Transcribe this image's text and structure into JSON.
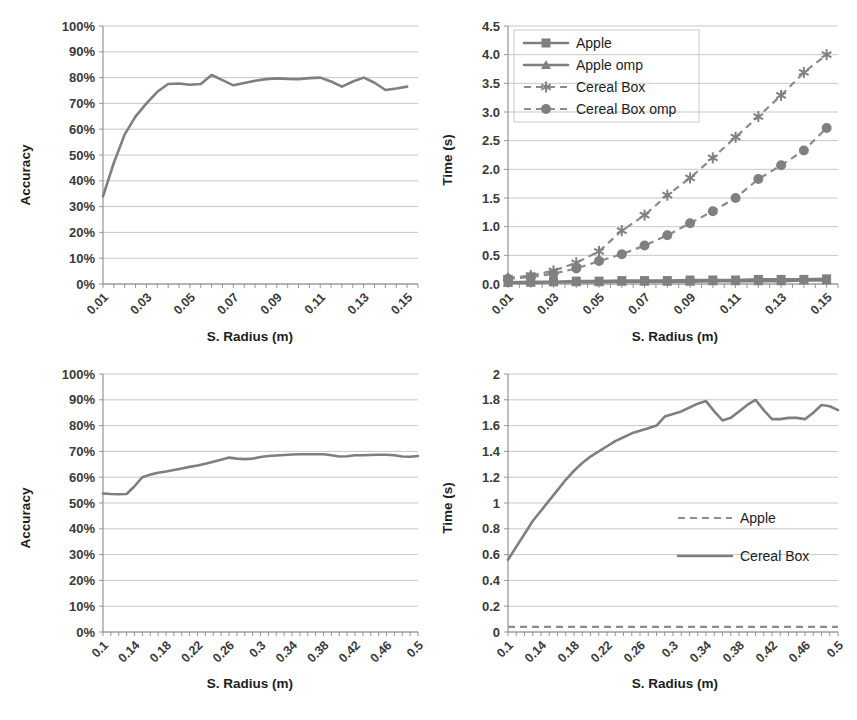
{
  "figure": {
    "panels": [
      "accuracy-small-radius",
      "time-small-radius",
      "accuracy-large-radius",
      "time-large-radius"
    ],
    "axis_title_x": "S. Radius (m)",
    "axis_title_y_accuracy": "Accuracy",
    "axis_title_y_time": "Time (s)",
    "colors": {
      "line": "#7f7f7f",
      "grid": "#b9b9b9",
      "axis": "#8a8a8a",
      "text": "#262626"
    }
  },
  "chart_data": [
    {
      "id": "accuracy-small-radius",
      "type": "line",
      "title": "",
      "xlabel": "S. Radius (m)",
      "ylabel": "Accuracy",
      "xlim": [
        0.01,
        0.155
      ],
      "ylim": [
        0,
        1.0
      ],
      "grid": true,
      "legend": null,
      "ytick_labels": [
        "100%",
        "90%",
        "80%",
        "70%",
        "60%",
        "50%",
        "40%",
        "30%",
        "20%",
        "10%",
        "0%"
      ],
      "ytick_values": [
        1.0,
        0.9,
        0.8,
        0.7,
        0.6,
        0.5,
        0.4,
        0.3,
        0.2,
        0.1,
        0.0
      ],
      "xtick_labels": [
        "0.01",
        "0.03",
        "0.05",
        "0.07",
        "0.09",
        "0.11",
        "0.13",
        "0.15"
      ],
      "xtick_values": [
        0.01,
        0.03,
        0.05,
        0.07,
        0.09,
        0.11,
        0.13,
        0.15
      ],
      "x": [
        0.01,
        0.015,
        0.02,
        0.025,
        0.03,
        0.035,
        0.04,
        0.045,
        0.05,
        0.055,
        0.06,
        0.065,
        0.07,
        0.075,
        0.08,
        0.085,
        0.09,
        0.095,
        0.1,
        0.105,
        0.11,
        0.115,
        0.12,
        0.125,
        0.13,
        0.135,
        0.14,
        0.145,
        0.15
      ],
      "series": [
        {
          "name": "Accuracy",
          "values": [
            0.34,
            0.47,
            0.58,
            0.65,
            0.7,
            0.745,
            0.775,
            0.777,
            0.772,
            0.775,
            0.81,
            0.79,
            0.77,
            0.779,
            0.788,
            0.794,
            0.797,
            0.795,
            0.794,
            0.798,
            0.8,
            0.785,
            0.765,
            0.785,
            0.8,
            0.78,
            0.752,
            0.758,
            0.765
          ]
        }
      ]
    },
    {
      "id": "time-small-radius",
      "type": "line",
      "title": "",
      "xlabel": "S. Radius (m)",
      "ylabel": "Time (s)",
      "xlim": [
        0.01,
        0.155
      ],
      "ylim": [
        0,
        4.5
      ],
      "grid": true,
      "legend": {
        "position": "top-left",
        "entries": [
          "Apple",
          "Apple omp",
          "Cereal Box",
          "Cereal Box omp"
        ]
      },
      "ytick_labels": [
        "4.5",
        "4.0",
        "3.5",
        "3.0",
        "2.5",
        "2.0",
        "1.5",
        "1.0",
        "0.5",
        "0.0"
      ],
      "ytick_values": [
        4.5,
        4.0,
        3.5,
        3.0,
        2.5,
        2.0,
        1.5,
        1.0,
        0.5,
        0.0
      ],
      "xtick_labels": [
        "0.01",
        "0.03",
        "0.05",
        "0.07",
        "0.09",
        "0.11",
        "0.13",
        "0.15"
      ],
      "xtick_values": [
        0.01,
        0.03,
        0.05,
        0.07,
        0.09,
        0.11,
        0.13,
        0.15
      ],
      "x": [
        0.01,
        0.02,
        0.03,
        0.04,
        0.05,
        0.06,
        0.07,
        0.08,
        0.09,
        0.1,
        0.11,
        0.12,
        0.13,
        0.14,
        0.15
      ],
      "series": [
        {
          "name": "Apple",
          "marker": "square",
          "line_style": "solid",
          "values": [
            0.03,
            0.04,
            0.04,
            0.05,
            0.05,
            0.06,
            0.06,
            0.06,
            0.07,
            0.07,
            0.07,
            0.08,
            0.08,
            0.08,
            0.09
          ]
        },
        {
          "name": "Apple omp",
          "marker": "triangle",
          "line_style": "solid",
          "values": [
            0.02,
            0.02,
            0.03,
            0.03,
            0.03,
            0.04,
            0.04,
            0.04,
            0.04,
            0.05,
            0.05,
            0.05,
            0.05,
            0.06,
            0.06
          ]
        },
        {
          "name": "Cereal Box",
          "marker": "asterisk",
          "line_style": "dashed",
          "values": [
            0.1,
            0.15,
            0.23,
            0.37,
            0.57,
            0.93,
            1.2,
            1.55,
            1.85,
            2.2,
            2.56,
            2.92,
            3.29,
            3.69,
            4.0
          ]
        },
        {
          "name": "Cereal Box omp",
          "marker": "circle",
          "line_style": "dashed",
          "values": [
            0.09,
            0.12,
            0.18,
            0.27,
            0.4,
            0.52,
            0.67,
            0.85,
            1.06,
            1.27,
            1.5,
            1.83,
            2.07,
            2.33,
            2.72,
            3.02
          ]
        }
      ]
    },
    {
      "id": "accuracy-large-radius",
      "type": "line",
      "title": "",
      "xlabel": "S. Radius (m)",
      "ylabel": "Accuracy",
      "xlim": [
        0.1,
        0.5
      ],
      "ylim": [
        0,
        1.0
      ],
      "grid": true,
      "legend": null,
      "ytick_labels": [
        "100%",
        "90%",
        "80%",
        "70%",
        "60%",
        "50%",
        "40%",
        "30%",
        "20%",
        "10%",
        "0%"
      ],
      "ytick_values": [
        1.0,
        0.9,
        0.8,
        0.7,
        0.6,
        0.5,
        0.4,
        0.3,
        0.2,
        0.1,
        0.0
      ],
      "xtick_labels": [
        "0.1",
        "0.14",
        "0.18",
        "0.22",
        "0.26",
        "0.3",
        "0.34",
        "0.38",
        "0.42",
        "0.46",
        "0.5"
      ],
      "xtick_values": [
        0.1,
        0.14,
        0.18,
        0.22,
        0.26,
        0.3,
        0.34,
        0.38,
        0.42,
        0.46,
        0.5
      ],
      "x": [
        0.1,
        0.11,
        0.12,
        0.13,
        0.14,
        0.15,
        0.16,
        0.17,
        0.18,
        0.19,
        0.2,
        0.21,
        0.22,
        0.23,
        0.24,
        0.25,
        0.26,
        0.27,
        0.28,
        0.29,
        0.3,
        0.31,
        0.32,
        0.33,
        0.34,
        0.35,
        0.36,
        0.37,
        0.38,
        0.39,
        0.4,
        0.41,
        0.42,
        0.43,
        0.44,
        0.45,
        0.46,
        0.47,
        0.48,
        0.49,
        0.5
      ],
      "series": [
        {
          "name": "Accuracy",
          "values": [
            0.537,
            0.535,
            0.534,
            0.535,
            0.565,
            0.6,
            0.61,
            0.617,
            0.622,
            0.628,
            0.634,
            0.64,
            0.645,
            0.652,
            0.66,
            0.668,
            0.676,
            0.672,
            0.67,
            0.672,
            0.678,
            0.682,
            0.684,
            0.686,
            0.688,
            0.689,
            0.689,
            0.689,
            0.689,
            0.685,
            0.68,
            0.681,
            0.685,
            0.685,
            0.686,
            0.687,
            0.687,
            0.685,
            0.68,
            0.679,
            0.682
          ]
        }
      ]
    },
    {
      "id": "time-large-radius",
      "type": "line",
      "title": "",
      "xlabel": "S. Radius (m)",
      "ylabel": "Time (s)",
      "xlim": [
        0.1,
        0.5
      ],
      "ylim": [
        0,
        2
      ],
      "grid": true,
      "legend": {
        "position": "middle-right",
        "entries": [
          "Apple",
          "Cereal Box"
        ]
      },
      "ytick_labels": [
        "2",
        "1.8",
        "1.6",
        "1.4",
        "1.2",
        "1",
        "0.8",
        "0.6",
        "0.4",
        "0.2",
        "0"
      ],
      "ytick_values": [
        2,
        1.8,
        1.6,
        1.4,
        1.2,
        1,
        0.8,
        0.6,
        0.4,
        0.2,
        0
      ],
      "xtick_labels": [
        "0.1",
        "0.14",
        "0.18",
        "0.22",
        "0.26",
        "0.3",
        "0.34",
        "0.38",
        "0.42",
        "0.46",
        "0.5"
      ],
      "xtick_values": [
        0.1,
        0.14,
        0.18,
        0.22,
        0.26,
        0.3,
        0.34,
        0.38,
        0.42,
        0.46,
        0.5
      ],
      "x": [
        0.1,
        0.11,
        0.12,
        0.13,
        0.14,
        0.15,
        0.16,
        0.17,
        0.18,
        0.19,
        0.2,
        0.21,
        0.22,
        0.23,
        0.24,
        0.25,
        0.26,
        0.27,
        0.28,
        0.29,
        0.3,
        0.31,
        0.32,
        0.33,
        0.34,
        0.35,
        0.36,
        0.37,
        0.38,
        0.39,
        0.4,
        0.41,
        0.42,
        0.43,
        0.44,
        0.45,
        0.46,
        0.47,
        0.48,
        0.49,
        0.5
      ],
      "series": [
        {
          "name": "Apple",
          "line_style": "dashed",
          "values": [
            0.04,
            0.04,
            0.04,
            0.04,
            0.04,
            0.04,
            0.04,
            0.04,
            0.04,
            0.04,
            0.04,
            0.04,
            0.04,
            0.04,
            0.04,
            0.04,
            0.04,
            0.04,
            0.04,
            0.04,
            0.04,
            0.04,
            0.04,
            0.04,
            0.04,
            0.04,
            0.04,
            0.04,
            0.04,
            0.04,
            0.04,
            0.04,
            0.04,
            0.04,
            0.04,
            0.04,
            0.04,
            0.04,
            0.04,
            0.04,
            0.04
          ]
        },
        {
          "name": "Cereal Box",
          "line_style": "solid",
          "values": [
            0.56,
            0.66,
            0.76,
            0.86,
            0.94,
            1.02,
            1.1,
            1.18,
            1.25,
            1.31,
            1.36,
            1.4,
            1.44,
            1.48,
            1.51,
            1.54,
            1.56,
            1.58,
            1.6,
            1.67,
            1.69,
            1.71,
            1.74,
            1.77,
            1.79,
            1.71,
            1.64,
            1.66,
            1.71,
            1.76,
            1.8,
            1.72,
            1.65,
            1.65,
            1.66,
            1.66,
            1.65,
            1.7,
            1.76,
            1.75,
            1.72
          ]
        }
      ]
    }
  ]
}
